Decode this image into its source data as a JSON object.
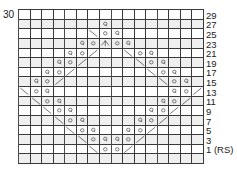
{
  "chart_data": {
    "type": "table",
    "title": "",
    "xlabel": "",
    "ylabel": "",
    "columns": 16,
    "rows": 16,
    "top_left_label": "30",
    "row_numbers_side": "right",
    "row_numbers": [
      "29",
      "27",
      "25",
      "23",
      "21",
      "19",
      "17",
      "15",
      "13",
      "11",
      "9",
      "7",
      "5",
      "3",
      "1 (RS)"
    ],
    "legend_entries": [],
    "symbol_key": {
      "blank": "knit (RS) / purl (WS)",
      "Q": "knit through back loop (twisted stitch)",
      "o": "yarn over",
      "/": "k2tog (right-leaning decrease)",
      "\\": "ssk (left-leaning decrease)",
      "^": "central double decrease"
    },
    "colors": {
      "grid_line": "#3a3a3a",
      "repeat_line": "#4a4a4a",
      "tint_row": "#efefef",
      "symbol": "#2a2a2a",
      "text": "#1a1a1a",
      "background": "#ffffff"
    },
    "tinted_rows": [
      1,
      3,
      5,
      7,
      9,
      11,
      13,
      15
    ],
    "grid": [
      [
        "",
        "",
        "",
        "",
        "",
        "",
        "",
        "",
        "",
        "",
        "",
        "",
        "",
        "",
        "",
        ""
      ],
      [
        "",
        "",
        "",
        "",
        "",
        "",
        "",
        "Q",
        "",
        "",
        "",
        "",
        "",
        "",
        "",
        ""
      ],
      [
        "",
        "",
        "",
        "",
        "",
        "",
        "\\",
        "o",
        "Q",
        "",
        "",
        "",
        "",
        "",
        "",
        ""
      ],
      [
        "",
        "",
        "",
        "",
        "",
        "Q",
        "o",
        "^",
        "o",
        "Q",
        "",
        "",
        "",
        "",
        "",
        ""
      ],
      [
        "",
        "",
        "",
        "",
        "Q",
        "o",
        "/",
        "",
        "",
        "\\",
        "o",
        "Q",
        "",
        "",
        "",
        ""
      ],
      [
        "",
        "",
        "",
        "Q",
        "o",
        "/",
        "",
        "",
        "",
        "",
        "\\",
        "o",
        "Q",
        "",
        "",
        ""
      ],
      [
        "",
        "",
        "Q",
        "o",
        "/",
        "",
        "",
        "",
        "",
        "",
        "",
        "\\",
        "o",
        "Q",
        "",
        ""
      ],
      [
        "",
        "Q",
        "o",
        "/",
        "",
        "",
        "",
        "",
        "",
        "",
        "",
        "",
        "\\",
        "o",
        "Q",
        ""
      ],
      [
        "\\",
        "o",
        "Q",
        "",
        "",
        "",
        "",
        "",
        "",
        "",
        "",
        "",
        "",
        "Q",
        "o",
        "/"
      ],
      [
        "",
        "\\",
        "o",
        "Q",
        "",
        "",
        "",
        "",
        "",
        "",
        "",
        "",
        "Q",
        "o",
        "/",
        ""
      ],
      [
        "",
        "",
        "\\",
        "o",
        "Q",
        "",
        "",
        "",
        "",
        "",
        "",
        "Q",
        "o",
        "/",
        "",
        ""
      ],
      [
        "",
        "",
        "",
        "\\",
        "o",
        "Q",
        "",
        "",
        "",
        "",
        "Q",
        "o",
        "/",
        "",
        "",
        ""
      ],
      [
        "",
        "",
        "",
        "",
        "\\",
        "o",
        "Q",
        "",
        "",
        "Q",
        "o",
        "/",
        "",
        "",
        "",
        ""
      ],
      [
        "",
        "",
        "",
        "",
        "",
        "\\",
        "o",
        "Q",
        "Q",
        "o",
        "/",
        "",
        "",
        "",
        "",
        ""
      ],
      [
        "",
        "",
        "",
        "",
        "",
        "",
        "\\",
        "o",
        "o",
        "/",
        "",
        "",
        "",
        "",
        "",
        ""
      ],
      [
        "",
        "",
        "",
        "",
        "",
        "",
        "",
        "",
        "",
        "",
        "",
        "",
        "",
        "",
        "",
        ""
      ]
    ]
  }
}
